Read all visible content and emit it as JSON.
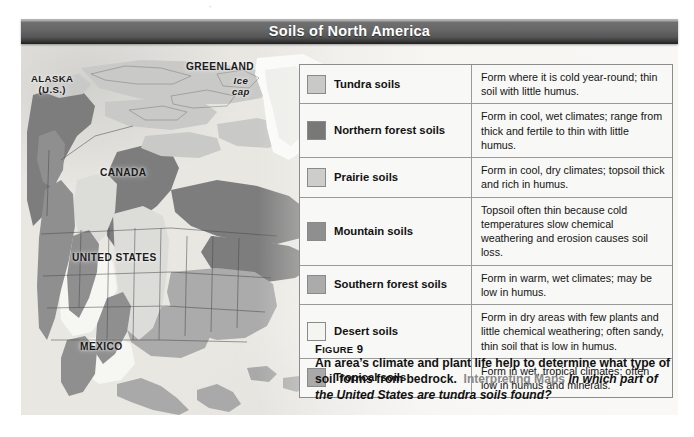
{
  "figure": {
    "title": "Soils of North America",
    "map_labels": [
      {
        "name": "alaska",
        "text": "ALASKA\n(U.S.)",
        "style": "upright",
        "x": 30,
        "y": 74,
        "size": 9.6
      },
      {
        "name": "greenland",
        "text": "GREENLAND",
        "style": "upright",
        "x": 186,
        "y": 63,
        "size": 10.2
      },
      {
        "name": "greenland-ice",
        "text": "Ice\ncap",
        "style": "italic",
        "x": 230,
        "y": 76,
        "size": 9.6
      },
      {
        "name": "canada",
        "text": "CANADA",
        "style": "upright",
        "x": 98,
        "y": 168,
        "size": 10.2
      },
      {
        "name": "united-states",
        "text": "UNITED STATES",
        "style": "upright",
        "x": 73,
        "y": 253,
        "size": 10.2
      },
      {
        "name": "mexico",
        "text": "MEXICO",
        "style": "upright",
        "x": 79,
        "y": 342,
        "size": 10.2
      }
    ],
    "legend": {
      "rows": [
        {
          "key": "tundra",
          "label": "Tundra soils",
          "color": "#c9c9c7",
          "description": "Form where it is cold year-round; thin soil with little humus."
        },
        {
          "key": "northern-forest",
          "label": "Northern forest soils",
          "color": "#787878",
          "description": "Form in cool, wet climates; range from thick and fertile to thin with little humus."
        },
        {
          "key": "prairie",
          "label": "Prairie soils",
          "color": "#cdcdcb",
          "description": "Form in cool, dry climates; topsoil thick and rich in humus."
        },
        {
          "key": "mountain",
          "label": "Mountain soils",
          "color": "#8f8f8f",
          "description": "Topsoil often thin because cold temperatures slow chemical weathering and erosion causes soil loss."
        },
        {
          "key": "southern-forest",
          "label": "Southern forest soils",
          "color": "#ababab",
          "description": "Form in warm, wet climates; may be low in humus."
        },
        {
          "key": "desert",
          "label": "Desert soils",
          "color": "#f4f4f1",
          "description": "Form in dry areas with few plants and little chemical weathering; often sandy, thin soil that is low in humus."
        },
        {
          "key": "tropical",
          "label": "Tropical soils",
          "color": "#a9a9a9",
          "description": "Form in wet, tropical climates; often low in humus and minerals."
        }
      ]
    },
    "caption": {
      "figure_label_big": "F",
      "figure_label_rest": "IGURE",
      "figure_number": "9",
      "body": "An area’s climate and plant life help to determine what type of soil forms from bedrock.",
      "highlight": "Interpreting Maps",
      "question": "In which part of the United States are tundra soils found?"
    }
  }
}
